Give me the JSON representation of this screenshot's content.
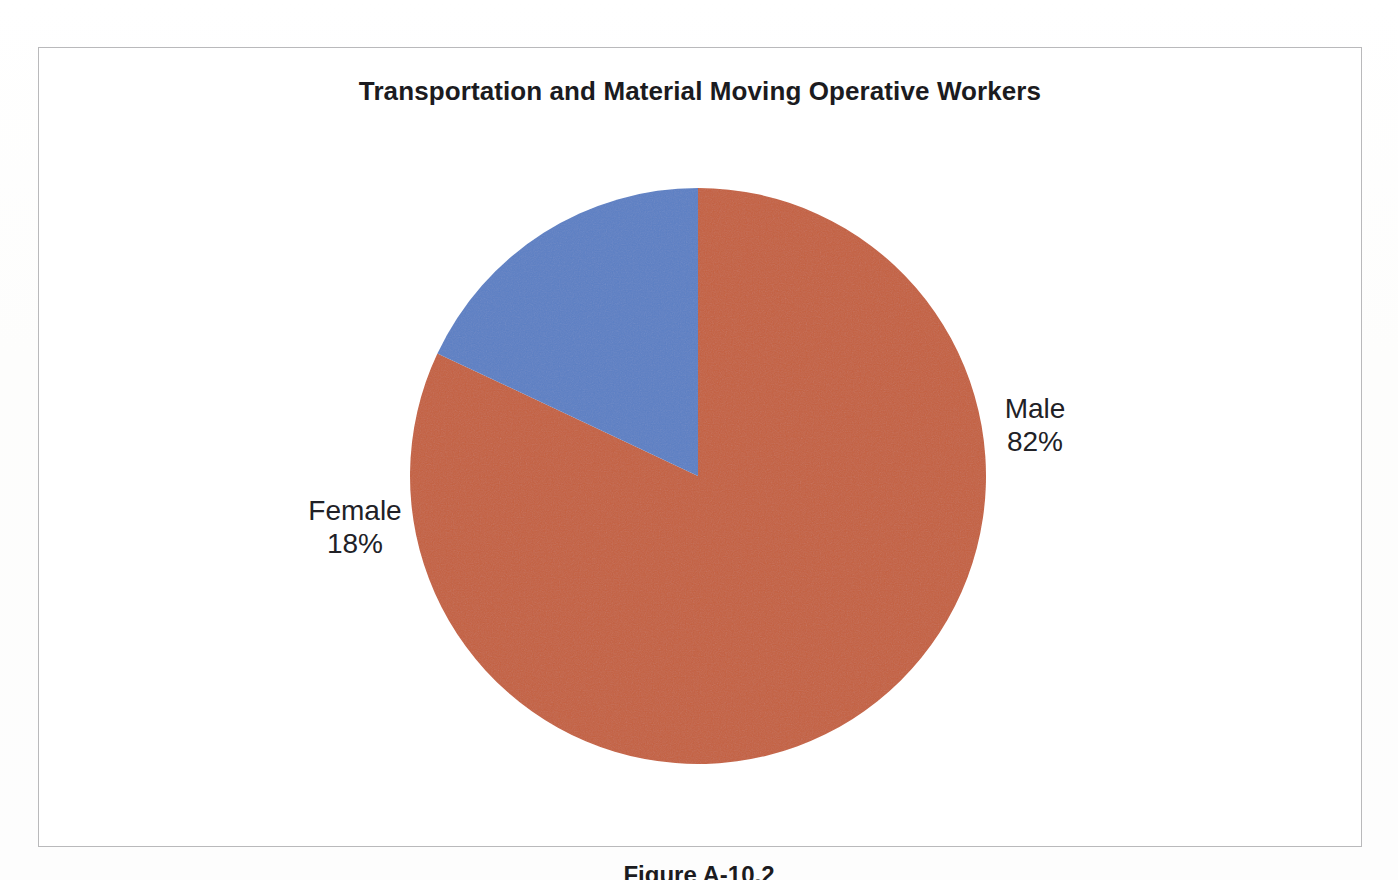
{
  "figure": {
    "caption": "Figure A-10.2"
  },
  "chart_data": {
    "type": "pie",
    "title": "Transportation and Material Moving Operative Workers",
    "xlabel": "",
    "ylabel": "",
    "legend_position": "none",
    "grid": false,
    "units": "percent",
    "start_angle_deg": 90,
    "direction": "clockwise",
    "categories": [
      "Male",
      "Female"
    ],
    "values": [
      82,
      18
    ],
    "labels": [
      "Male\n82%",
      "Female\n18%"
    ],
    "slices": [
      {
        "name": "Male",
        "value": 82,
        "value_label": "82%",
        "color": "#c4603f",
        "sweep_deg": 295.2,
        "label_side": "right"
      },
      {
        "name": "Female",
        "value": 18,
        "value_label": "18%",
        "color": "#5b7fc4",
        "sweep_deg": 64.8,
        "label_side": "left"
      }
    ],
    "colors": [
      "#c4603f",
      "#5b7fc4"
    ]
  },
  "style": {
    "frame_color": "#b9b9bb",
    "background": "#ffffff",
    "title_color": "#1b1b20",
    "label_color": "#212126"
  }
}
